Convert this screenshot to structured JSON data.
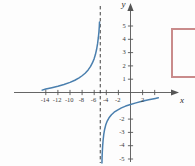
{
  "figure": {
    "background_color": "#fdfdfd",
    "curve_color": "#4a7fae",
    "axis_color": "#555555",
    "asymptote_color": "#2b2b2b",
    "bracket_color": "#c98b8b",
    "x_axis_label": "x",
    "y_axis_label": "y"
  },
  "chart_data": {
    "type": "line",
    "title": "",
    "xlabel": "x",
    "ylabel": "y",
    "xlim": [
      -15.5,
      5.5
    ],
    "ylim": [
      -5.6,
      5.6
    ],
    "grid": false,
    "legend": null,
    "x_ticks": [
      -14,
      -12,
      -10,
      -8,
      -6,
      -4,
      -2,
      2,
      4
    ],
    "x_tick_labels": [
      "-14",
      "-12",
      "-10",
      "-8",
      "-6",
      "-4",
      "-2",
      "2",
      ""
    ],
    "y_ticks": [
      5,
      4,
      3,
      2,
      1,
      -2,
      -3,
      -4,
      -5
    ],
    "y_tick_labels": [
      "5",
      "4",
      "3",
      "2",
      "1",
      "-2",
      "-3",
      "-4",
      "-5"
    ],
    "annotations": [
      {
        "name": "vertical-asymptote",
        "type": "vline",
        "x": -5,
        "style": "dashed",
        "label": ""
      }
    ],
    "series": [
      {
        "name": "left-branch",
        "style": "solid",
        "color": "#4a7fae",
        "points": [
          [
            -14.6,
            0.18
          ],
          [
            -14.0,
            0.26
          ],
          [
            -13.0,
            0.36
          ],
          [
            -12.0,
            0.47
          ],
          [
            -11.0,
            0.6
          ],
          [
            -10.0,
            0.76
          ],
          [
            -9.2,
            0.92
          ],
          [
            -8.5,
            1.1
          ],
          [
            -8.0,
            1.26
          ],
          [
            -7.5,
            1.45
          ],
          [
            -7.0,
            1.7
          ],
          [
            -6.6,
            1.96
          ],
          [
            -6.3,
            2.22
          ],
          [
            -6.0,
            2.55
          ],
          [
            -5.8,
            2.85
          ],
          [
            -5.6,
            3.25
          ],
          [
            -5.45,
            3.65
          ],
          [
            -5.32,
            4.1
          ],
          [
            -5.22,
            4.55
          ],
          [
            -5.15,
            5.0
          ],
          [
            -5.12,
            5.3
          ]
        ]
      },
      {
        "name": "right-branch",
        "style": "solid",
        "color": "#4a7fae",
        "points": [
          [
            -4.72,
            -5.3
          ],
          [
            -4.7,
            -4.9
          ],
          [
            -4.66,
            -4.45
          ],
          [
            -4.6,
            -4.0
          ],
          [
            -4.52,
            -3.55
          ],
          [
            -4.42,
            -3.15
          ],
          [
            -4.28,
            -2.78
          ],
          [
            -4.1,
            -2.45
          ],
          [
            -3.85,
            -2.15
          ],
          [
            -3.55,
            -1.9
          ],
          [
            -3.15,
            -1.67
          ],
          [
            -2.7,
            -1.48
          ],
          [
            -2.15,
            -1.32
          ],
          [
            -1.5,
            -1.16
          ],
          [
            -0.8,
            -1.02
          ],
          [
            0.0,
            -0.9
          ],
          [
            0.9,
            -0.78
          ],
          [
            1.9,
            -0.66
          ],
          [
            3.0,
            -0.55
          ],
          [
            4.1,
            -0.45
          ],
          [
            4.6,
            -0.4
          ]
        ]
      }
    ]
  },
  "bracket": {
    "name": "callout-bracket",
    "visible": true,
    "color": "#c98b8b"
  }
}
